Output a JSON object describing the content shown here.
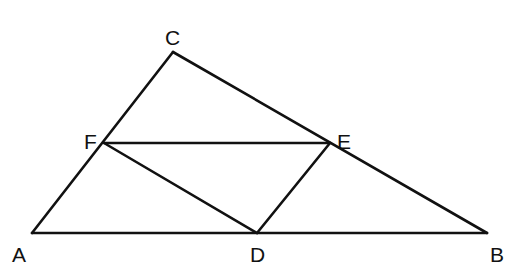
{
  "diagram": {
    "type": "geometry-triangle",
    "stroke_color": "#111111",
    "background": "#ffffff",
    "points": {
      "A": {
        "x": 32,
        "y": 233
      },
      "B": {
        "x": 487,
        "y": 233
      },
      "C": {
        "x": 173,
        "y": 52
      },
      "D": {
        "x": 257,
        "y": 233
      },
      "E": {
        "x": 330,
        "y": 143
      },
      "F": {
        "x": 104,
        "y": 143
      }
    },
    "labels": {
      "A": "A",
      "B": "B",
      "C": "C",
      "D": "D",
      "E": "E",
      "F": "F"
    },
    "segments": [
      [
        "A",
        "B"
      ],
      [
        "A",
        "C"
      ],
      [
        "C",
        "B"
      ],
      [
        "F",
        "E"
      ],
      [
        "F",
        "D"
      ],
      [
        "D",
        "E"
      ]
    ]
  }
}
